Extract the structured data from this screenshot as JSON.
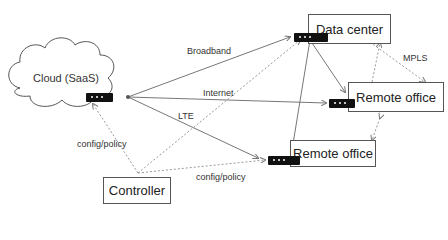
{
  "nodes": {
    "cloud": {
      "label": "Cloud (SaaS)"
    },
    "data_center": {
      "label": "Data center"
    },
    "remote_office_1": {
      "label": "Remote office"
    },
    "remote_office_2": {
      "label": "Remote office"
    },
    "controller": {
      "label": "Controller"
    }
  },
  "links": {
    "broadband": "Broadband",
    "internet": "Internet",
    "lte": "LTE",
    "mpls": "MPLS",
    "config_policy_1": "config/policy",
    "config_policy_2": "config/policy"
  },
  "colors": {
    "line": "#777777",
    "device": "#111111"
  }
}
